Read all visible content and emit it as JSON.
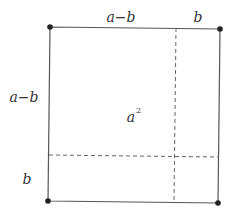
{
  "diagram": {
    "title": "",
    "colors": {
      "line": "#555555",
      "dot": "#222222",
      "text": "#333333",
      "dash": "#666666"
    },
    "labels": {
      "top_left_segment": "a−b",
      "top_right_segment": "b",
      "left_upper_segment": "a−b",
      "left_lower_segment": "b",
      "center_area": "a",
      "center_area_exponent": "2"
    },
    "corners": [
      {
        "name": "top-left",
        "x": 50,
        "y": 27
      },
      {
        "name": "top-right",
        "x": 220,
        "y": 29
      },
      {
        "name": "bottom-right",
        "x": 218,
        "y": 203
      },
      {
        "name": "bottom-left",
        "x": 48,
        "y": 201
      }
    ],
    "dashed_lines": [
      {
        "orientation": "vertical",
        "x1": 176,
        "y1": 28,
        "x2": 174,
        "y2": 202
      },
      {
        "orientation": "horizontal",
        "x1": 49,
        "y1": 155,
        "x2": 219,
        "y2": 157
      }
    ]
  }
}
